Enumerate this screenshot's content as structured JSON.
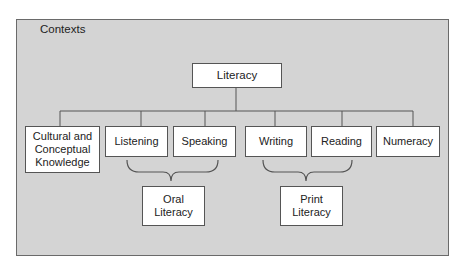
{
  "diagram": {
    "container_label": "Contexts",
    "root": {
      "label": "Literacy"
    },
    "children": [
      {
        "id": "cultural",
        "label": "Cultural and Conceptual Knowledge"
      },
      {
        "id": "listening",
        "label": "Listening"
      },
      {
        "id": "speaking",
        "label": "Speaking"
      },
      {
        "id": "writing",
        "label": "Writing"
      },
      {
        "id": "reading",
        "label": "Reading"
      },
      {
        "id": "numeracy",
        "label": "Numeracy"
      }
    ],
    "groups": [
      {
        "id": "oral",
        "label": "Oral Literacy",
        "members": [
          "Listening",
          "Speaking"
        ]
      },
      {
        "id": "print",
        "label": "Print Literacy",
        "members": [
          "Writing",
          "Reading"
        ]
      }
    ],
    "colors": {
      "container_fill": "#d4d4d4",
      "box_fill": "#ffffff",
      "line": "#555555"
    }
  }
}
